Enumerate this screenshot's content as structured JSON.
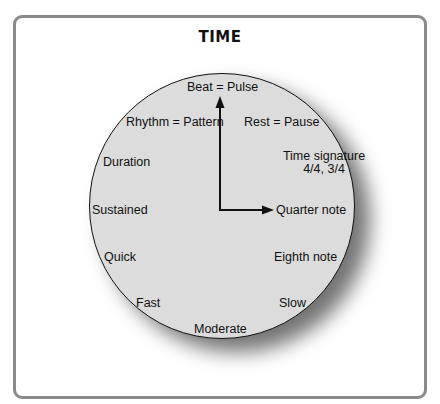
{
  "title": "TIME",
  "colors": {
    "frame_border": "#8a8a8a",
    "clock_face": "#dcdcdc",
    "text": "#111111"
  },
  "clock": {
    "labels": {
      "top": "Beat = Pulse",
      "upper_left": "Rhythm = Pattern",
      "upper_right": "Rest = Pause",
      "left_high": "Duration",
      "right_high_line1": "Time signature",
      "right_high_line2": "4/4, 3/4",
      "left_mid": "Sustained",
      "right_mid": "Quarter note",
      "left_low": "Quick",
      "right_low": "Eighth note",
      "bottom_left": "Fast",
      "bottom_right": "Slow",
      "bottom": "Moderate"
    },
    "hands": {
      "hour_hand_points_to": "Quarter note",
      "minute_hand_points_to": "Beat = Pulse"
    }
  }
}
